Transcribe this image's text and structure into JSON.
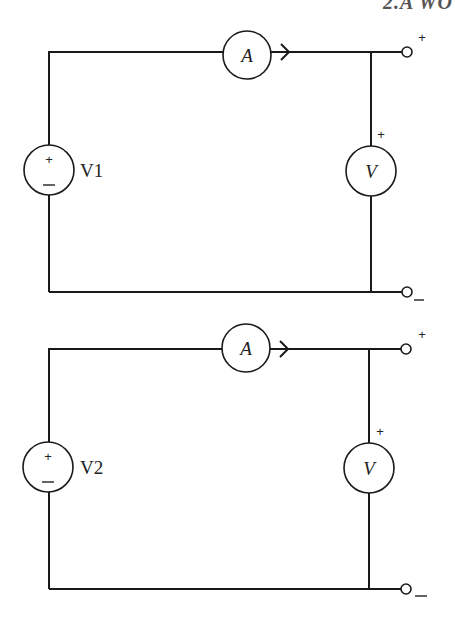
{
  "header": {
    "text": "2.A WO"
  },
  "circuits": [
    {
      "id": "circuit-1",
      "source_label": "V1",
      "source_plus": "+",
      "source_minus": "–",
      "ammeter_label": "A",
      "voltmeter_label": "V",
      "voltmeter_plus": "+",
      "terminal_plus": "+",
      "terminal_minus": "–"
    },
    {
      "id": "circuit-2",
      "source_label": "V2",
      "source_plus": "+",
      "source_minus": "–",
      "ammeter_label": "A",
      "voltmeter_label": "V",
      "voltmeter_plus": "+",
      "terminal_plus": "+",
      "terminal_minus": "–"
    }
  ],
  "colors": {
    "line": "#1a1a1a",
    "background": "#ffffff"
  }
}
